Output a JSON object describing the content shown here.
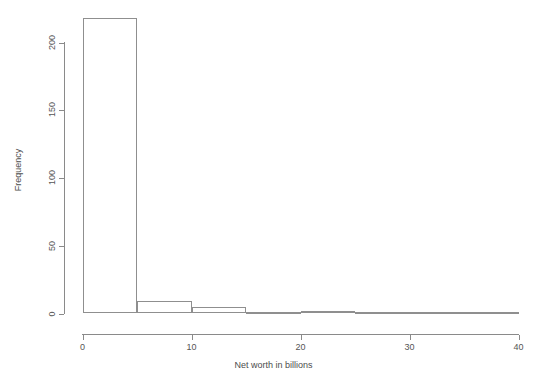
{
  "chart_data": {
    "type": "bar",
    "subtype": "histogram",
    "title": "",
    "xlabel": "Net worth in billions",
    "ylabel": "Frequency",
    "xlim": [
      0,
      40
    ],
    "ylim": [
      0,
      220
    ],
    "grid": false,
    "legend": null,
    "bin_width": 5,
    "bin_edges": [
      0,
      5,
      10,
      15,
      20,
      25,
      30,
      35,
      40
    ],
    "categories": [
      "0-5",
      "5-10",
      "10-15",
      "15-20",
      "20-25",
      "25-30",
      "30-35",
      "35-40"
    ],
    "values": [
      218,
      9,
      5,
      0,
      2,
      0,
      0,
      1
    ],
    "xticks": [
      0,
      10,
      20,
      30,
      40
    ],
    "xtick_labels": [
      "0",
      "10",
      "20",
      "30",
      "40"
    ],
    "yticks": [
      0,
      50,
      100,
      150,
      200
    ],
    "ytick_labels": [
      "0",
      "50",
      "100",
      "150",
      "200"
    ],
    "bar_fill": "#ffffff",
    "bar_stroke": "#8f8f8f",
    "axis_color": "#8a8a8a",
    "background": "#ffffff"
  }
}
